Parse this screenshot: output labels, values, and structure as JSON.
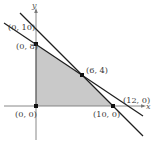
{
  "diagram": {
    "type": "feasible-region",
    "axes": {
      "x_label": "x",
      "y_label": "y"
    },
    "colors": {
      "region_fill": "#c9c9c9",
      "line": "#1e1e1e",
      "axis": "#7a7a7a",
      "point": "#111111"
    },
    "lines": [
      {
        "name": "line-through-0-10-and-10-0",
        "points": [
          [
            0,
            10
          ],
          [
            10,
            0
          ]
        ]
      },
      {
        "name": "line-through-0-8-and-12-0",
        "points": [
          [
            0,
            8
          ],
          [
            12,
            0
          ]
        ]
      }
    ],
    "region_vertices": [
      [
        0,
        0
      ],
      [
        0,
        8
      ],
      [
        6,
        4
      ],
      [
        10,
        0
      ]
    ],
    "labels": {
      "p_0_10": "(0, 10)",
      "p_0_8": "(0, 8)",
      "p_6_4": "(6, 4)",
      "p_12_0": "(12, 0)",
      "p_10_0": "(10, 0)",
      "p_0_0": "(0, 0)"
    }
  }
}
